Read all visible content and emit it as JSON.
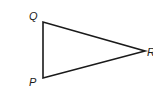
{
  "diagram": {
    "type": "triangle",
    "vertices": [
      {
        "label": "Q",
        "x": 43,
        "y": 22
      },
      {
        "label": "P",
        "x": 43,
        "y": 78
      },
      {
        "label": "R",
        "x": 145,
        "y": 51
      }
    ],
    "edges": [
      [
        "Q",
        "P"
      ],
      [
        "P",
        "R"
      ],
      [
        "R",
        "Q"
      ]
    ],
    "labels": {
      "q": "Q",
      "p": "P",
      "r": "R"
    },
    "colors": {
      "stroke": "#1a1a1a",
      "background": "#ffffff"
    }
  }
}
